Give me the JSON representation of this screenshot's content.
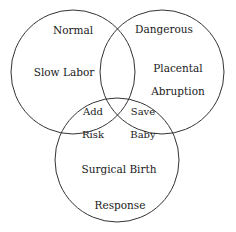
{
  "diagram": {
    "type": "venn-3-set",
    "background_color": "#ffffff",
    "stroke_color": "#333333",
    "text_color": "#1a1a1a",
    "canvas": {
      "width": 236,
      "height": 232
    },
    "circles": [
      {
        "name": "left-circle",
        "cx": 73,
        "cy": 72,
        "r": 62
      },
      {
        "name": "right-circle",
        "cx": 162,
        "cy": 72,
        "r": 62
      },
      {
        "name": "bottom-circle",
        "cx": 117,
        "cy": 160,
        "r": 62
      }
    ],
    "labels": {
      "normal": "Normal",
      "dangerous": "Dangerous",
      "slow_labor": "Slow Labor",
      "placental_abruption_line1": "Placental",
      "placental_abruption_line2": "Abruption",
      "add_risk_line1": "Add",
      "add_risk_line2": "Risk",
      "save_baby_line1": "Save",
      "save_baby_line2": "Baby",
      "surgical_birth": "Surgical Birth",
      "response": "Response"
    }
  }
}
